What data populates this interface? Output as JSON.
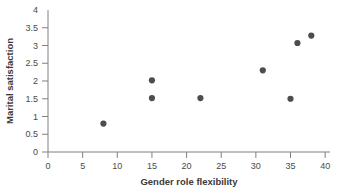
{
  "chart_data": {
    "type": "scatter",
    "title": "",
    "xlabel": "Gender role flexibility",
    "ylabel": "Marital satisfaction",
    "xlim": [
      0,
      40
    ],
    "ylim": [
      0,
      4
    ],
    "xticks": [
      0,
      5,
      10,
      15,
      20,
      25,
      30,
      35,
      40
    ],
    "xtick_labels": [
      "0",
      "5",
      "10",
      "15",
      "20",
      "25",
      "30",
      "35",
      "40"
    ],
    "yticks": [
      0,
      0.5,
      1,
      1.5,
      2,
      2.5,
      3,
      3.5,
      4
    ],
    "ytick_labels": [
      "0",
      "0.5",
      "1",
      "1.5",
      "2",
      "2.5",
      "3",
      "3.5",
      "4"
    ],
    "grid": false,
    "legend": false,
    "marker_color": "#4d4d4d",
    "axis_color": "#808080",
    "points": [
      {
        "x": 8,
        "y": 0.8
      },
      {
        "x": 15,
        "y": 2.02
      },
      {
        "x": 15,
        "y": 1.52
      },
      {
        "x": 22,
        "y": 1.52
      },
      {
        "x": 31,
        "y": 2.3
      },
      {
        "x": 35,
        "y": 1.5
      },
      {
        "x": 36,
        "y": 3.07
      },
      {
        "x": 38,
        "y": 3.28
      }
    ]
  }
}
